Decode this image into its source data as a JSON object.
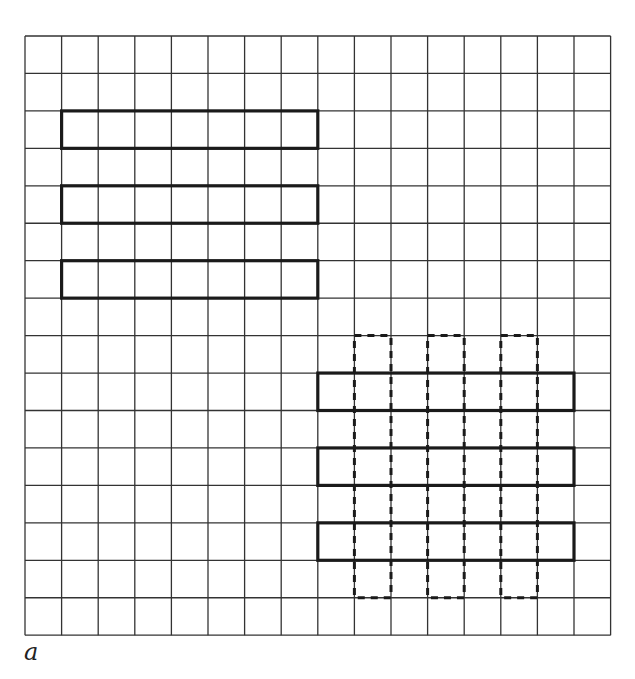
{
  "figure": {
    "caption": "a",
    "grid": {
      "cols": 16,
      "rows": 16,
      "origin_x": 25,
      "origin_y": 36,
      "cell_w": 36.6,
      "cell_h": 37.45,
      "line_color": "#333333",
      "line_width": 1.3
    },
    "bold_rects": [
      {
        "col": 1,
        "row": 2,
        "w": 7,
        "h": 1
      },
      {
        "col": 1,
        "row": 4,
        "w": 7,
        "h": 1
      },
      {
        "col": 1,
        "row": 6,
        "w": 7,
        "h": 1
      },
      {
        "col": 8,
        "row": 9,
        "w": 7,
        "h": 1
      },
      {
        "col": 8,
        "row": 11,
        "w": 7,
        "h": 1
      },
      {
        "col": 8,
        "row": 13,
        "w": 7,
        "h": 1
      }
    ],
    "dashed_rects": [
      {
        "col": 9,
        "row": 8,
        "w": 1,
        "h": 7
      },
      {
        "col": 11,
        "row": 8,
        "w": 1,
        "h": 7
      },
      {
        "col": 13,
        "row": 8,
        "w": 1,
        "h": 7
      }
    ],
    "bold_color": "#1a1a1a",
    "bold_width": 3.2,
    "dashed_color": "#1a1a1a",
    "dashed_width": 3
  }
}
